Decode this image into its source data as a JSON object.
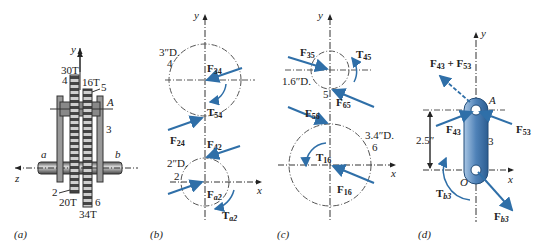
{
  "figure": {
    "panels": [
      {
        "id": "a",
        "caption": "(a)",
        "axes": {
          "y": "y",
          "z": "z"
        },
        "labels": {
          "gear4": "4",
          "gear4_teeth": "30T",
          "gear5": "5",
          "gear5_teeth": "16T",
          "gear2": "2",
          "gear2_teeth": "20T",
          "gear6": "6",
          "gear6_teeth": "34T",
          "arm": "3",
          "pin": "A",
          "shaft_a": "a",
          "shaft_b": "b"
        }
      },
      {
        "id": "b",
        "caption": "(b)",
        "axes": {
          "x": "x",
          "y": "y"
        },
        "gear4": {
          "diameter": "3″D.",
          "label": "4"
        },
        "gear2": {
          "diameter": "2″D.",
          "label": "2"
        },
        "forces": {
          "F34": "34",
          "T54": "54",
          "F24": "24",
          "F42": "42",
          "Fa2": "a2",
          "Ta2": "a2"
        }
      },
      {
        "id": "c",
        "caption": "(c)",
        "axes": {
          "x": "x",
          "y": "y"
        },
        "gear5": {
          "diameter": "1.6″D.",
          "label": "5"
        },
        "gear6": {
          "diameter": "3.4″D.",
          "label": "6"
        },
        "forces": {
          "F35": "35",
          "T45": "45",
          "F65": "65",
          "F56": "56",
          "T16": "16",
          "F16": "16"
        }
      },
      {
        "id": "d",
        "caption": "(d)",
        "axes": {
          "x": "x",
          "y": "y"
        },
        "arm_label": "3",
        "points": {
          "A": "A",
          "O": "O"
        },
        "dimension": "2.5″",
        "forces": {
          "F43": "43",
          "F53": "53",
          "sum_a": "43",
          "sum_b": "53",
          "Tb3": "b3",
          "Fb3": "b3"
        }
      }
    ],
    "colors": {
      "force": "#2f6fa8",
      "line": "#333333",
      "gear": "#8a8a8a",
      "arm": "#5d8fc0"
    }
  }
}
